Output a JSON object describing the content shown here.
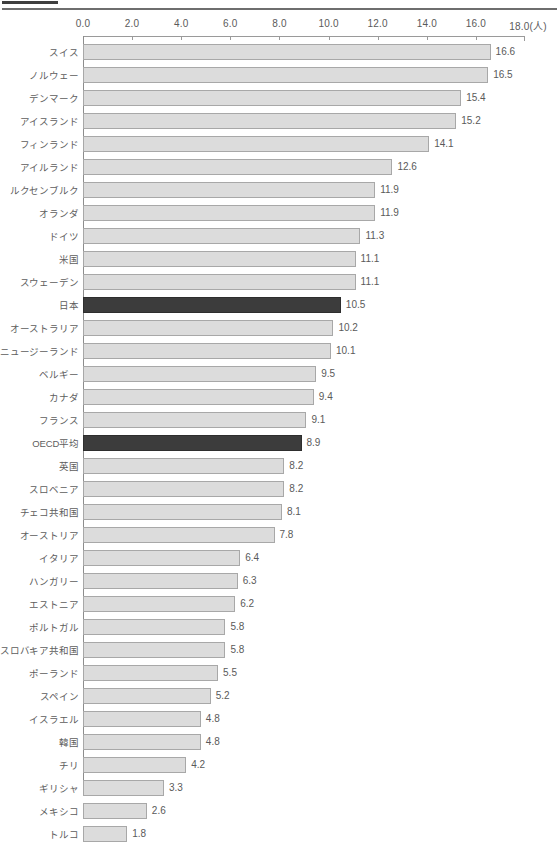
{
  "header": {
    "short_rule_label": "",
    "long_rule_label": ""
  },
  "chart_data": {
    "type": "bar",
    "orientation": "horizontal",
    "title": "",
    "xlabel": "(人)",
    "ylabel": "",
    "xlim": [
      0.0,
      18.0
    ],
    "xticks": [
      "0.0",
      "2.0",
      "4.0",
      "6.0",
      "8.0",
      "10.0",
      "12.0",
      "14.0",
      "16.0",
      "18.0"
    ],
    "xtick_values": [
      0.0,
      2.0,
      4.0,
      6.0,
      8.0,
      10.0,
      12.0,
      14.0,
      16.0,
      18.0
    ],
    "unit_suffix": "(人)",
    "grid": false,
    "legend": "none",
    "highlight_color": "#3c3c3c",
    "bar_color": "#dcdcdc",
    "bar_border_color": "#a8a8a8",
    "categories": [
      "スイス",
      "ノルウェー",
      "デンマーク",
      "アイスランド",
      "フィンランド",
      "アイルランド",
      "ルクセンブルク",
      "オランダ",
      "ドイツ",
      "米国",
      "スウェーデン",
      "日本",
      "オーストラリア",
      "ニュージーランド",
      "ベルギー",
      "カナダ",
      "フランス",
      "OECD平均",
      "英国",
      "スロベニア",
      "チェコ共和国",
      "オーストリア",
      "イタリア",
      "ハンガリー",
      "エストニア",
      "ポルトガル",
      "スロバキア共和国",
      "ポーランド",
      "スペイン",
      "イスラエル",
      "韓国",
      "チリ",
      "ギリシャ",
      "メキシコ",
      "トルコ"
    ],
    "values": [
      16.6,
      16.5,
      15.4,
      15.2,
      14.1,
      12.6,
      11.9,
      11.9,
      11.3,
      11.1,
      11.1,
      10.5,
      10.2,
      10.1,
      9.5,
      9.4,
      9.1,
      8.9,
      8.2,
      8.2,
      8.1,
      7.8,
      6.4,
      6.3,
      6.2,
      5.8,
      5.8,
      5.5,
      5.2,
      4.8,
      4.8,
      4.2,
      3.3,
      2.6,
      1.8
    ],
    "value_labels": [
      "16.6",
      "16.5",
      "15.4",
      "15.2",
      "14.1",
      "12.6",
      "11.9",
      "11.9",
      "11.3",
      "11.1",
      "11.1",
      "10.5",
      "10.2",
      "10.1",
      "9.5",
      "9.4",
      "9.1",
      "8.9",
      "8.2",
      "8.2",
      "8.1",
      "7.8",
      "6.4",
      "6.3",
      "6.2",
      "5.8",
      "5.8",
      "5.5",
      "5.2",
      "4.8",
      "4.8",
      "4.2",
      "3.3",
      "2.6",
      "1.8"
    ],
    "highlighted": [
      false,
      false,
      false,
      false,
      false,
      false,
      false,
      false,
      false,
      false,
      false,
      true,
      false,
      false,
      false,
      false,
      false,
      true,
      false,
      false,
      false,
      false,
      false,
      false,
      false,
      false,
      false,
      false,
      false,
      false,
      false,
      false,
      false,
      false,
      false
    ]
  }
}
